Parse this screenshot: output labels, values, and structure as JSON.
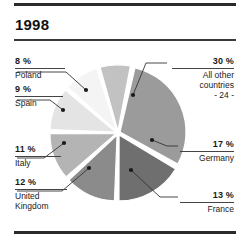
{
  "chart_data": {
    "type": "pie",
    "title": "1998",
    "xlabel": "",
    "ylabel": "",
    "legend_position": "callout-labels",
    "grid": false,
    "categories": [
      "All other countries - 24 -",
      "Germany",
      "France",
      "United Kingdom",
      "Italy",
      "Spain",
      "Poland"
    ],
    "values": [
      30,
      17,
      13,
      12,
      11,
      9,
      8
    ],
    "units": "%",
    "slices": [
      {
        "id": "other",
        "percent_label": "30 %",
        "value": 30,
        "name": "All other countries",
        "name_line1": "All other",
        "name_line2": "countries",
        "name_line3": "- 24 -",
        "color": "#9b9b9b",
        "side": "right"
      },
      {
        "id": "germany",
        "percent_label": "17 %",
        "value": 17,
        "name": "Germany",
        "color": "#6f6f6f",
        "side": "right"
      },
      {
        "id": "france",
        "percent_label": "13 %",
        "value": 13,
        "name": "France",
        "color": "#8b8b8b",
        "side": "right"
      },
      {
        "id": "united-kingdom",
        "percent_label": "12 %",
        "value": 12,
        "name": "United Kingdom",
        "name_line1": "United",
        "name_line2": "Kingdom",
        "color": "#b4b4b4",
        "side": "left"
      },
      {
        "id": "italy",
        "percent_label": "11 %",
        "value": 11,
        "name": "Italy",
        "color": "#e4e4e4",
        "side": "left"
      },
      {
        "id": "spain",
        "percent_label": "9 %",
        "value": 9,
        "name": "Spain",
        "color": "#f4f4f4",
        "side": "left"
      },
      {
        "id": "poland",
        "percent_label": "8 %",
        "value": 8,
        "name": "Poland",
        "color": "#c2c2c2",
        "side": "left"
      }
    ]
  },
  "header": {
    "title": "1998"
  },
  "labels": {
    "other": {
      "pct": "30 %",
      "l1": "All other",
      "l2": "countries",
      "l3": "- 24 -"
    },
    "germany": {
      "pct": "17 %",
      "name": "Germany"
    },
    "france": {
      "pct": "13 %",
      "name": "France"
    },
    "uk": {
      "pct": "12 %",
      "l1": "United",
      "l2": "Kingdom"
    },
    "italy": {
      "pct": "11 %",
      "name": "Italy"
    },
    "spain": {
      "pct": "9 %",
      "name": "Spain"
    },
    "poland": {
      "pct": "8 %",
      "name": "Poland"
    }
  },
  "colors": {
    "rule": "#2b2b2b",
    "text": "#1a1a1a",
    "leader": "#333333",
    "slice_gap": "#ffffff"
  }
}
